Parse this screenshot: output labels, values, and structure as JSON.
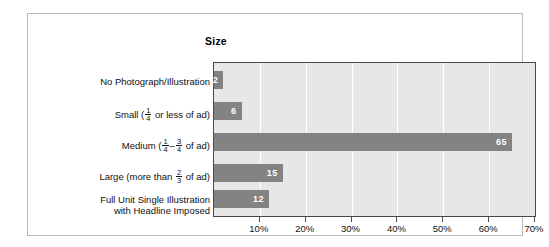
{
  "chart_data": {
    "type": "bar",
    "orientation": "horizontal",
    "title": "Size",
    "xlabel": "",
    "ylabel": "",
    "xlim": [
      0,
      70
    ],
    "xtick_labels": [
      "10%",
      "20%",
      "30%",
      "40%",
      "50%",
      "60%",
      "70%"
    ],
    "xtick_values": [
      10,
      20,
      30,
      40,
      50,
      60,
      70
    ],
    "grid": true,
    "legend": false,
    "categories": [
      "No Photograph/Illustration",
      "Small ( 1/4 or less of ad)",
      "Medium ( 1/4 – 3/4 of ad)",
      "Large (more than 2/3 of ad)",
      "Full Unit Single Illustration with Headline Imposed"
    ],
    "values": [
      2,
      6,
      65,
      15,
      12
    ],
    "value_labels": [
      "2",
      "6",
      "65",
      "15",
      "12"
    ],
    "bar_color": "#838383",
    "plot_background": "#e7e7e7",
    "gridline_color": "#ffffff",
    "value_label_color": "#ffffff"
  },
  "labels": {
    "row0": {
      "text": "No Photograph/Illustration"
    },
    "row1": {
      "pre": "Small (",
      "num": "1",
      "den": "4",
      "post": " or less of ad)"
    },
    "row2": {
      "pre": "Medium (",
      "num1": "1",
      "den1": "4",
      "dash": "–",
      "num2": "3",
      "den2": "4",
      "post": " of ad)"
    },
    "row3": {
      "pre": "Large (more than ",
      "num": "2",
      "den": "3",
      "post": " of ad)"
    },
    "row4": {
      "line1": "Full Unit Single Illustration",
      "line2": "with Headline Imposed"
    }
  }
}
